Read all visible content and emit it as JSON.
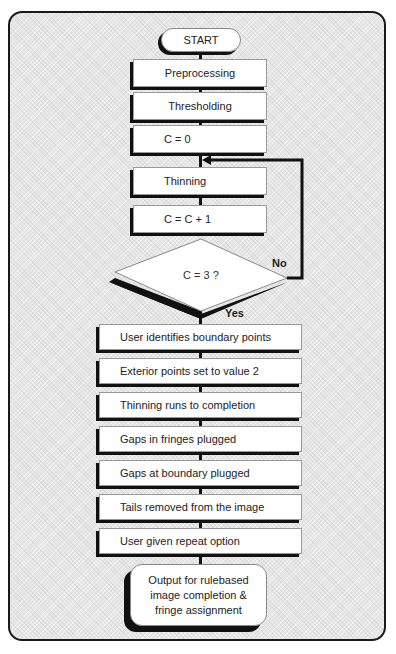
{
  "diagram": {
    "type": "flowchart",
    "start": "START",
    "steps_top": [
      "Preprocessing",
      "Thresholding",
      "C = 0",
      "Thinning",
      "C = C + 1"
    ],
    "decision": {
      "label": "C = 3 ?",
      "no_label": "No",
      "yes_label": "Yes"
    },
    "steps_bottom": [
      "User identifies boundary points",
      "Exterior points set to value 2",
      "Thinning runs to completion",
      "Gaps in fringes plugged",
      "Gaps at boundary plugged",
      "Tails removed from the image",
      "User given repeat option"
    ],
    "output": {
      "line1": "Output for rulebased",
      "line2": "image completion &",
      "line3": "fringe assignment"
    }
  }
}
